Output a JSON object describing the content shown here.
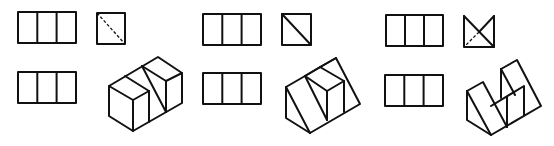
{
  "figure": {
    "line_color": "#111111",
    "background": "#ffffff",
    "groups": [
      {
        "id": 1,
        "front_view": "rectangle divided into 3 vertical cells",
        "side_view": "square with dashed diagonal (hidden edge)",
        "top_view": "rectangle divided into 3 vertical cells",
        "isometric": "block of 3 cubes with diagonal cut on middle section"
      },
      {
        "id": 2,
        "front_view": "rectangle divided into 3 vertical cells",
        "side_view": "square with solid diagonal",
        "top_view": "rectangle divided into 3 vertical cells",
        "isometric": "wedge prism with cube in middle section"
      },
      {
        "id": 3,
        "front_view": "rectangle divided into 3 vertical cells",
        "side_view": "square with bow-tie top and dashed diagonal",
        "top_view": "rectangle divided into 3 vertical cells",
        "isometric": "two wedges with a notch between forming a W shape"
      }
    ]
  }
}
